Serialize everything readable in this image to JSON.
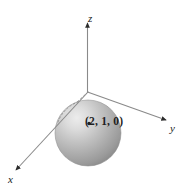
{
  "figure": {
    "caption_fragment": "",
    "axes": {
      "z": {
        "label": "z",
        "direction": "up"
      },
      "y": {
        "label": "y",
        "direction": "right-down"
      },
      "x": {
        "label": "x",
        "direction": "left-down"
      }
    },
    "point": {
      "label": "(2, 1, 0)",
      "marker": "dot-marker",
      "coordinates": [
        2,
        1,
        0
      ]
    },
    "sphere": {
      "name": "shaded-sphere",
      "center_label": "(2, 1, 0)",
      "highlight_color": "#e8e8e8",
      "mid_color": "#b6b6b6",
      "shadow_color": "#8f8f8f",
      "edge_color": "#7d7d7d"
    },
    "colors": {
      "background": "#ffffff",
      "axis_line": "#8a8a8a",
      "axis_arrow": "#2b2b2b",
      "text": "#1a1a1a",
      "hidden_arc": "#9a9a9a"
    }
  }
}
